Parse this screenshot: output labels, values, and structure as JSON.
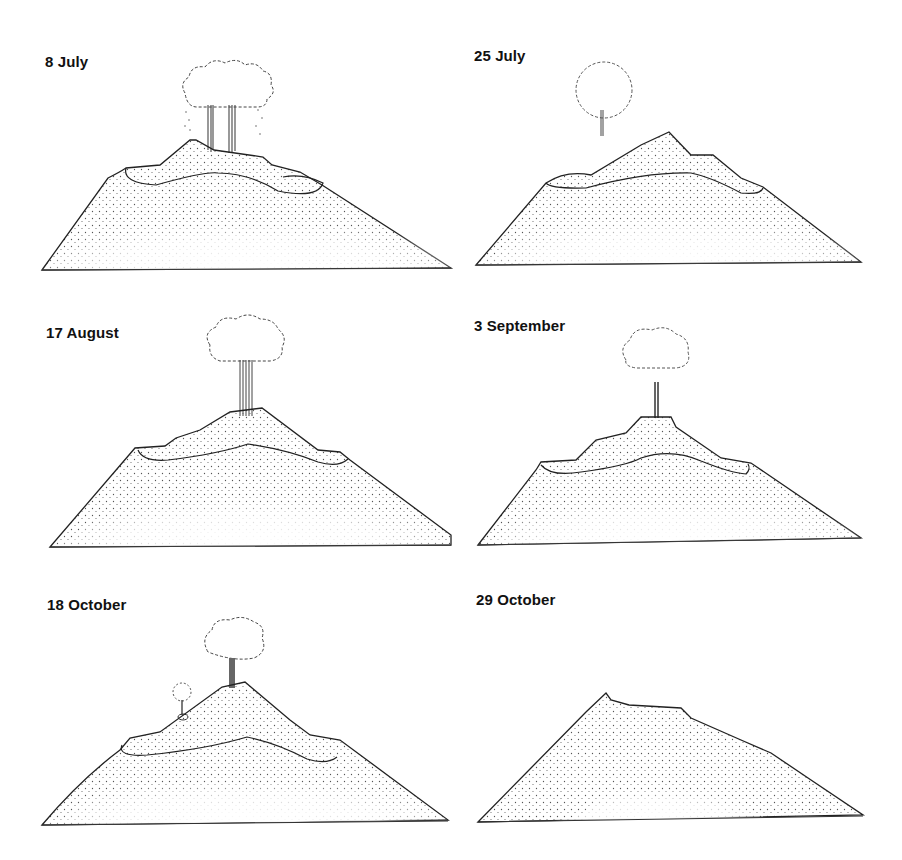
{
  "figure": {
    "panels": [
      {
        "id": "p1",
        "label": "8 July",
        "position": "top-left",
        "plumes": 2,
        "state": "eruption with two vents and ash plume"
      },
      {
        "id": "p2",
        "label": "25 July",
        "position": "top-right",
        "plumes": 1,
        "state": "single small plume"
      },
      {
        "id": "p3",
        "label": "17 August",
        "position": "middle-left",
        "plumes": 1,
        "state": "strong plume from central cone"
      },
      {
        "id": "p4",
        "label": "3 September",
        "position": "middle-right",
        "plumes": 1,
        "state": "plume from flat-topped cone"
      },
      {
        "id": "p5",
        "label": "18 October",
        "position": "bottom-left",
        "plumes": 2,
        "state": "main plume plus small flank vent"
      },
      {
        "id": "p6",
        "label": "29 October",
        "position": "bottom-right",
        "plumes": 0,
        "state": "dormant, crater filled"
      }
    ]
  },
  "colors": {
    "ink": "#222222",
    "stipple": "#555555",
    "background": "#ffffff"
  }
}
